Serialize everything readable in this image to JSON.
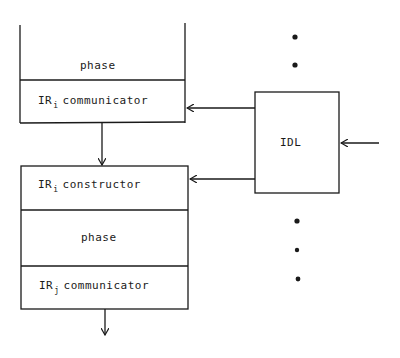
{
  "diagram": {
    "top_block": {
      "phase_label": "phase",
      "communicator": {
        "prefix": "IR",
        "subscript": "i",
        "text": "communicator"
      }
    },
    "bottom_block": {
      "constructor": {
        "prefix": "IR",
        "subscript": "i",
        "text": "constructor"
      },
      "phase_label": "phase",
      "communicator": {
        "prefix": "IR",
        "subscript": "j",
        "text": "communicator"
      }
    },
    "idl_box": {
      "label": "IDL"
    },
    "ellipsis_dots": {
      "upper_count": 2,
      "lower_count": 3
    },
    "colors": {
      "line": "#1a1a1a",
      "background": "#ffffff"
    }
  }
}
